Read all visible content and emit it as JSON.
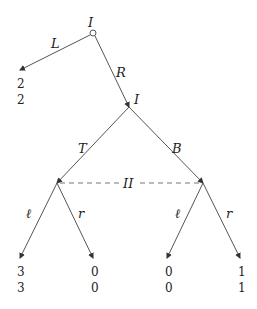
{
  "diagram": {
    "type": "extensive-form game tree",
    "root": {
      "player": "I",
      "x": 93,
      "y": 33
    },
    "nodes": {
      "n1": {
        "player": "I",
        "x": 129,
        "y": 107
      },
      "t": {
        "x": 57,
        "y": 183
      },
      "b": {
        "x": 203,
        "y": 183
      }
    },
    "edges": {
      "L": "L",
      "R": "R",
      "T": "T",
      "B": "B",
      "l1": "ℓ",
      "r1": "r",
      "l2": "ℓ",
      "r2": "r"
    },
    "information_set": {
      "player": "II"
    },
    "payoffs": {
      "L": {
        "p1": "2",
        "p2": "2"
      },
      "Tl": {
        "p1": "3",
        "p2": "3"
      },
      "Tr": {
        "p1": "0",
        "p2": "0"
      },
      "Bl": {
        "p1": "0",
        "p2": "0"
      },
      "Br": {
        "p1": "1",
        "p2": "1"
      }
    }
  }
}
